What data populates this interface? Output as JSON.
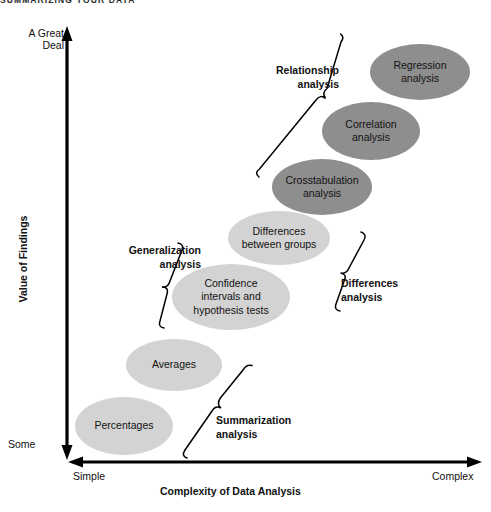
{
  "page": {
    "running_head": "SUMMARIZING YOUR DATA"
  },
  "axes": {
    "y": {
      "title": "Value of Findings",
      "high_label": "A Great\nDeal",
      "low_label": "Some"
    },
    "x": {
      "title": "Complexity of Data Analysis",
      "low_label": "Simple",
      "high_label": "Complex"
    }
  },
  "groups": [
    {
      "id": "relationship",
      "label": "Relationship\nanalysis"
    },
    {
      "id": "generalization",
      "label": "Generalization\nanalysis"
    },
    {
      "id": "differences",
      "label": "Differences\nanalysis"
    },
    {
      "id": "summarization",
      "label": "Summarization\nanalysis"
    }
  ],
  "colors": {
    "ellipse_light": "#d3d3d3",
    "ellipse_dark": "#8e8e8e",
    "axis": "#000000",
    "text": "#111111"
  },
  "chart_data": {
    "type": "scatter",
    "xlabel": "Complexity of Data Analysis",
    "ylabel": "Value of Findings",
    "xlim": [
      "Simple",
      "Complex"
    ],
    "ylim": [
      "Some",
      "A Great Deal"
    ],
    "grid": false,
    "legend": "none",
    "points": [
      {
        "label": "Percentages",
        "group": "summarization",
        "x": 124,
        "y": 426,
        "rx": 49,
        "ry": 29,
        "shade": "light"
      },
      {
        "label": "Averages",
        "group": "summarization",
        "x": 174,
        "y": 365,
        "rx": 48,
        "ry": 26,
        "shade": "light"
      },
      {
        "label": "Confidence\nintervals and\nhypothesis tests",
        "group": "generalization",
        "x": 231,
        "y": 297,
        "rx": 59,
        "ry": 33,
        "shade": "light"
      },
      {
        "label": "Differences\nbetween groups",
        "group": "differences",
        "x": 279,
        "y": 238,
        "rx": 51,
        "ry": 27,
        "shade": "light"
      },
      {
        "label": "Crosstabulation\nanalysis",
        "group": "relationship",
        "x": 322,
        "y": 187,
        "rx": 50,
        "ry": 28,
        "shade": "dark"
      },
      {
        "label": "Correlation\nanalysis",
        "group": "relationship",
        "x": 371,
        "y": 131,
        "rx": 49,
        "ry": 29,
        "shade": "dark"
      },
      {
        "label": "Regression\nanalysis",
        "group": "relationship",
        "x": 420,
        "y": 72,
        "rx": 50,
        "ry": 28,
        "shade": "dark"
      }
    ]
  }
}
